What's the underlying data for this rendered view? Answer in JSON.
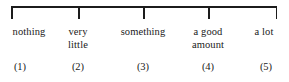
{
  "figure": {
    "name": "five-point-response-scale",
    "orientation": "horizontal",
    "line_color": "#1c1c1c",
    "text_color": "#1a1a1a",
    "background_color": "#ffffff"
  },
  "chart_data": {
    "type": "scale",
    "title": "",
    "xlabel": "",
    "ylabel": "",
    "grid": false,
    "legend": null,
    "axis": {
      "start_px": 11,
      "end_px": 277,
      "tick_count": 5
    },
    "categories": [
      "nothing",
      "very little",
      "something",
      "a good amount",
      "a lot"
    ],
    "values": [
      1,
      2,
      3,
      4,
      5
    ],
    "tick_labels": [
      "(1)",
      "(2)",
      "(3)",
      "(4)",
      "(5)"
    ]
  },
  "points": [
    {
      "value": 1,
      "number": "(1)",
      "label_line1": "nothing",
      "label_line2": "",
      "tick_x": 11,
      "label_center_x": 29,
      "number_center_x": 20
    },
    {
      "value": 2,
      "number": "(2)",
      "label_line1": "very",
      "label_line2": "little",
      "tick_x": 78,
      "label_center_x": 78,
      "number_center_x": 78
    },
    {
      "value": 3,
      "number": "(3)",
      "label_line1": "something",
      "label_line2": "",
      "tick_x": 143,
      "label_center_x": 143,
      "number_center_x": 143
    },
    {
      "value": 4,
      "number": "(4)",
      "label_line1": "a good",
      "label_line2": "amount",
      "tick_x": 208,
      "label_center_x": 208,
      "number_center_x": 208
    },
    {
      "value": 5,
      "number": "(5)",
      "label_line1": "a lot",
      "label_line2": "",
      "tick_x": 277,
      "label_center_x": 264,
      "number_center_x": 266
    }
  ]
}
